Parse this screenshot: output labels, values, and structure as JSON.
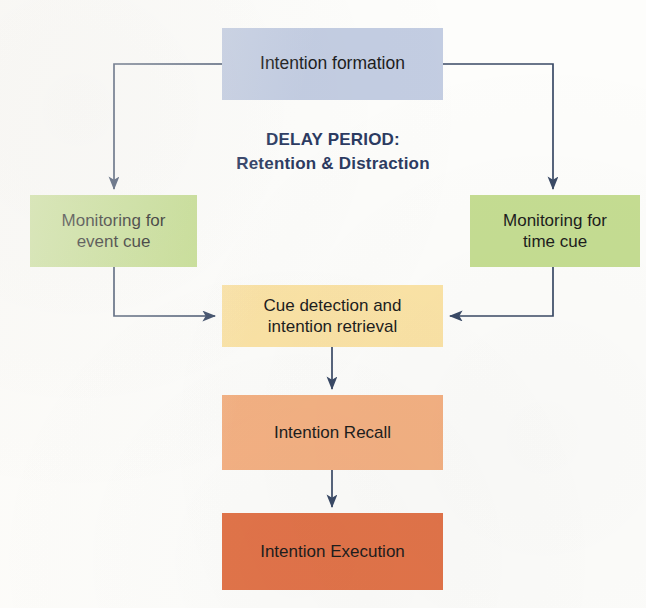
{
  "figure": {
    "background_color": "#fdfdfb",
    "connector_color": "#3a4a66",
    "text_color": "#1d1d1d"
  },
  "delay_period": {
    "line1": "DELAY PERIOD:",
    "line2": "Retention & Distraction",
    "color": "#2c3b62"
  },
  "nodes": {
    "intention_formation": {
      "label": "Intention formation",
      "fill": "#c3cde2"
    },
    "monitoring_event": {
      "line1": "Monitoring for",
      "line2": "event cue",
      "fill": "#c5dd92"
    },
    "monitoring_time": {
      "line1": "Monitoring for",
      "line2": "time cue",
      "fill": "#c5dd92"
    },
    "cue_detection": {
      "line1": "Cue detection and",
      "line2": "intention retrieval",
      "fill": "#fbe3a6"
    },
    "intention_recall": {
      "label": "Intention Recall",
      "fill": "#f4b183"
    },
    "intention_execution": {
      "label": "Intention Execution",
      "fill": "#e2744a"
    }
  },
  "connectors": [
    {
      "name": "intention-formation-to-monitoring-event",
      "from": "intention_formation",
      "to": "monitoring_event"
    },
    {
      "name": "intention-formation-to-monitoring-time",
      "from": "intention_formation",
      "to": "monitoring_time"
    },
    {
      "name": "monitoring-event-to-cue-detection",
      "from": "monitoring_event",
      "to": "cue_detection"
    },
    {
      "name": "monitoring-time-to-cue-detection",
      "from": "monitoring_time",
      "to": "cue_detection"
    },
    {
      "name": "cue-detection-to-intention-recall",
      "from": "cue_detection",
      "to": "intention_recall"
    },
    {
      "name": "intention-recall-to-intention-execution",
      "from": "intention_recall",
      "to": "intention_execution"
    }
  ]
}
